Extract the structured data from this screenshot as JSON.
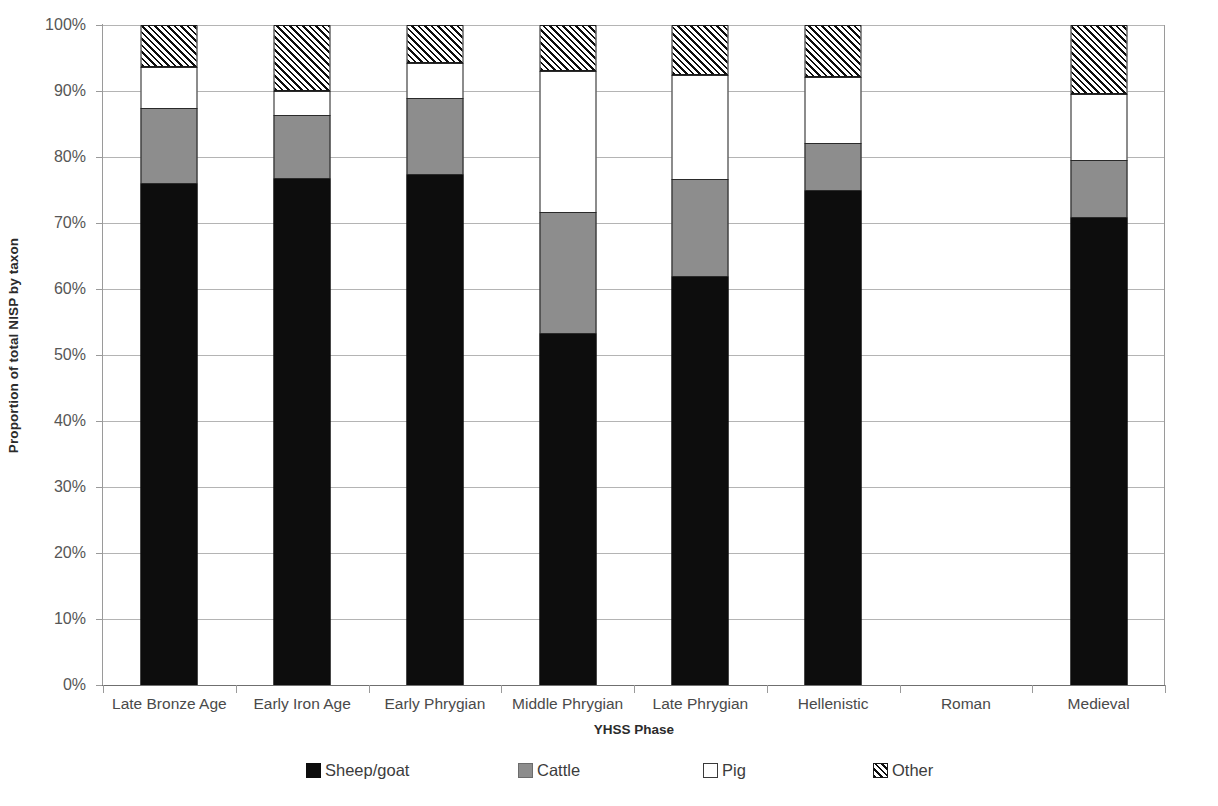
{
  "chart_data": {
    "type": "bar",
    "subtype": "stacked-percent",
    "title": "",
    "xlabel": "YHSS Phase",
    "ylabel": "Proportion of total NISP by taxon",
    "ylim": [
      0,
      100
    ],
    "yticks": [
      0,
      10,
      20,
      30,
      40,
      50,
      60,
      70,
      80,
      90,
      100
    ],
    "ytick_labels": [
      "0%",
      "10%",
      "20%",
      "30%",
      "40%",
      "50%",
      "60%",
      "70%",
      "80%",
      "90%",
      "100%"
    ],
    "grid": true,
    "legend_position": "bottom",
    "categories": [
      "Late Bronze Age",
      "Early Iron Age",
      "Early Phrygian",
      "Middle Phrygian",
      "Late Phrygian",
      "Hellenistic",
      "Roman",
      "Medieval"
    ],
    "series": [
      {
        "name": "Sheep/goat",
        "color": "#0d0d0d",
        "pattern": "solid",
        "values": [
          75.9,
          76.6,
          77.2,
          53.2,
          61.8,
          74.9,
          null,
          70.7
        ]
      },
      {
        "name": "Cattle",
        "color": "#8d8d8d",
        "pattern": "solid",
        "values": [
          11.5,
          9.8,
          11.7,
          18.4,
          14.8,
          7.3,
          null,
          8.9
        ]
      },
      {
        "name": "Pig",
        "color": "#ffffff",
        "pattern": "solid",
        "values": [
          6.3,
          3.6,
          5.3,
          21.5,
          15.8,
          10.0,
          null,
          10.0
        ]
      },
      {
        "name": "Other",
        "color": "#ffffff",
        "pattern": "diagonal-hatch",
        "values": [
          6.3,
          10.0,
          5.8,
          6.9,
          7.6,
          7.8,
          null,
          10.4
        ]
      }
    ]
  }
}
